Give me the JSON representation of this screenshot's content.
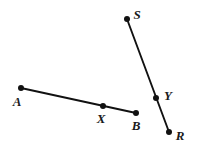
{
  "figure": {
    "background_color": "#ffffff",
    "stroke_color": "#111111",
    "label_color": "#1a1a1a",
    "width": 198,
    "height": 145,
    "segments": [
      {
        "name": "segment-AB",
        "from": "A",
        "to": "B",
        "x1": 21,
        "y1": 88,
        "x2": 136,
        "y2": 113,
        "stroke_width": 1.9
      },
      {
        "name": "segment-SR",
        "from": "S",
        "to": "R",
        "x1": 127,
        "y1": 19,
        "x2": 169,
        "y2": 132,
        "stroke_width": 1.9
      }
    ],
    "points": [
      {
        "id": "A",
        "label": "A",
        "cx": 21,
        "cy": 88,
        "r": 3.0,
        "label_x": 17,
        "label_y": 101
      },
      {
        "id": "X",
        "label": "X",
        "cx": 103,
        "cy": 106,
        "r": 3.0,
        "label_x": 101,
        "label_y": 118
      },
      {
        "id": "B",
        "label": "B",
        "cx": 136,
        "cy": 113,
        "r": 3.0,
        "label_x": 136,
        "label_y": 125
      },
      {
        "id": "S",
        "label": "S",
        "cx": 127,
        "cy": 19,
        "r": 3.0,
        "label_x": 137,
        "label_y": 14
      },
      {
        "id": "Y",
        "label": "Y",
        "cx": 156,
        "cy": 98,
        "r": 3.0,
        "label_x": 168,
        "label_y": 95
      },
      {
        "id": "R",
        "label": "R",
        "cx": 169,
        "cy": 132,
        "r": 3.0,
        "label_x": 180,
        "label_y": 135
      }
    ]
  }
}
